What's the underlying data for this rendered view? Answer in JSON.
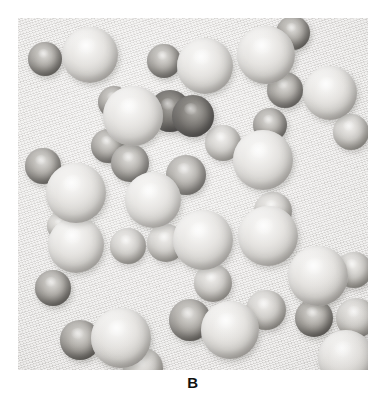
{
  "figure": {
    "caption": "B",
    "panel_label": "B",
    "background_color": "#e4e3e1",
    "canvas_color": "#ffffff",
    "panel": {
      "x": 18,
      "y": 18,
      "width": 350,
      "height": 352
    }
  },
  "legend": {
    "light_color": "#f2f1ef",
    "mid_color": "#cdcbc7",
    "dark_color": "#918e89",
    "very_dark_color": "#403e3b"
  },
  "chart_data": {
    "type": "scatter",
    "title": "B",
    "xlabel": "",
    "ylabel": "",
    "xlim": [
      0,
      350
    ],
    "ylim": [
      0,
      352
    ],
    "grid": false,
    "legend_position": "none",
    "series": [
      {
        "name": "particles",
        "points": [
          {
            "id": 1,
            "x": 27,
            "y": 41,
            "r": 17,
            "shade": "dark"
          },
          {
            "id": 2,
            "x": 72,
            "y": 37,
            "r": 28,
            "shade": "light"
          },
          {
            "id": 3,
            "x": 146,
            "y": 43,
            "r": 17,
            "shade": "dark"
          },
          {
            "id": 4,
            "x": 187,
            "y": 48,
            "r": 28,
            "shade": "light"
          },
          {
            "id": 5,
            "x": 248,
            "y": 37,
            "r": 29,
            "shade": "light"
          },
          {
            "id": 6,
            "x": 275,
            "y": 15,
            "r": 17,
            "shade": "dark"
          },
          {
            "id": 7,
            "x": 96,
            "y": 84,
            "r": 16,
            "shade": "dark"
          },
          {
            "id": 8,
            "x": 115,
            "y": 98,
            "r": 30,
            "shade": "light"
          },
          {
            "id": 9,
            "x": 152,
            "y": 93,
            "r": 21,
            "shade": "vdark"
          },
          {
            "id": 10,
            "x": 175,
            "y": 98,
            "r": 21,
            "shade": "vdark"
          },
          {
            "id": 11,
            "x": 267,
            "y": 72,
            "r": 18,
            "shade": "dark"
          },
          {
            "id": 12,
            "x": 312,
            "y": 75,
            "r": 27,
            "shade": "light"
          },
          {
            "id": 13,
            "x": 252,
            "y": 107,
            "r": 17,
            "shade": "dark"
          },
          {
            "id": 14,
            "x": 333,
            "y": 114,
            "r": 18,
            "shade": "mid"
          },
          {
            "id": 15,
            "x": 90,
            "y": 128,
            "r": 17,
            "shade": "dark"
          },
          {
            "id": 16,
            "x": 112,
            "y": 145,
            "r": 19,
            "shade": "dark"
          },
          {
            "id": 17,
            "x": 25,
            "y": 148,
            "r": 18,
            "shade": "dark"
          },
          {
            "id": 18,
            "x": 58,
            "y": 175,
            "r": 30,
            "shade": "light"
          },
          {
            "id": 19,
            "x": 168,
            "y": 157,
            "r": 20,
            "shade": "dark"
          },
          {
            "id": 20,
            "x": 135,
            "y": 182,
            "r": 28,
            "shade": "light"
          },
          {
            "id": 21,
            "x": 205,
            "y": 125,
            "r": 18,
            "shade": "mid"
          },
          {
            "id": 22,
            "x": 245,
            "y": 142,
            "r": 30,
            "shade": "light"
          },
          {
            "id": 23,
            "x": 255,
            "y": 193,
            "r": 19,
            "shade": "mid"
          },
          {
            "id": 24,
            "x": 43,
            "y": 208,
            "r": 14,
            "shade": "mid"
          },
          {
            "id": 25,
            "x": 58,
            "y": 227,
            "r": 28,
            "shade": "light"
          },
          {
            "id": 26,
            "x": 110,
            "y": 228,
            "r": 18,
            "shade": "mid"
          },
          {
            "id": 27,
            "x": 35,
            "y": 270,
            "r": 18,
            "shade": "dark"
          },
          {
            "id": 28,
            "x": 148,
            "y": 225,
            "r": 19,
            "shade": "mid"
          },
          {
            "id": 29,
            "x": 185,
            "y": 222,
            "r": 30,
            "shade": "light"
          },
          {
            "id": 30,
            "x": 250,
            "y": 218,
            "r": 30,
            "shade": "light"
          },
          {
            "id": 31,
            "x": 195,
            "y": 265,
            "r": 19,
            "shade": "mid"
          },
          {
            "id": 32,
            "x": 300,
            "y": 258,
            "r": 30,
            "shade": "light"
          },
          {
            "id": 33,
            "x": 336,
            "y": 252,
            "r": 18,
            "shade": "mid"
          },
          {
            "id": 34,
            "x": 62,
            "y": 322,
            "r": 20,
            "shade": "dark"
          },
          {
            "id": 35,
            "x": 103,
            "y": 320,
            "r": 30,
            "shade": "light"
          },
          {
            "id": 36,
            "x": 172,
            "y": 302,
            "r": 21,
            "shade": "dark"
          },
          {
            "id": 37,
            "x": 212,
            "y": 312,
            "r": 29,
            "shade": "light"
          },
          {
            "id": 38,
            "x": 248,
            "y": 292,
            "r": 20,
            "shade": "mid"
          },
          {
            "id": 39,
            "x": 296,
            "y": 300,
            "r": 19,
            "shade": "dark"
          },
          {
            "id": 40,
            "x": 338,
            "y": 300,
            "r": 20,
            "shade": "mid"
          },
          {
            "id": 41,
            "x": 328,
            "y": 340,
            "r": 28,
            "shade": "light"
          },
          {
            "id": 42,
            "x": 125,
            "y": 350,
            "r": 20,
            "shade": "mid"
          }
        ]
      }
    ]
  }
}
